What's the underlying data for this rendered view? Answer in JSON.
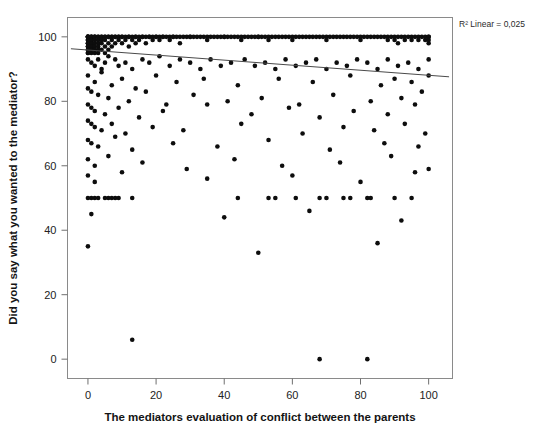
{
  "chart_data": {
    "type": "scatter",
    "title": "",
    "xlabel": "The mediators evaluation of conflict between the parents",
    "ylabel": "Did you say what you wanted to the mediator?",
    "xlim": [
      -6,
      107
    ],
    "ylim": [
      -6,
      106
    ],
    "xticks": [
      0,
      20,
      40,
      60,
      80,
      100
    ],
    "xticklabels": [
      "0",
      "20",
      "40",
      "60",
      "80",
      "100"
    ],
    "yticks": [
      0,
      20,
      40,
      60,
      80,
      100
    ],
    "yticklabels": [
      "0",
      "20",
      "40",
      "60",
      "80",
      "100"
    ],
    "grid": false,
    "legend": null,
    "annotations": [
      {
        "name": "r-squared-label",
        "text": "R² Linear = 0,025",
        "x": 107,
        "y": 105,
        "position": "top-right-outside"
      }
    ],
    "fit_line": {
      "name": "linear-fit",
      "type": "line",
      "r_squared": 0.025,
      "x": [
        -5,
        106
      ],
      "y": [
        96.3,
        87.6
      ],
      "slope": -0.0784,
      "intercept": 95.9
    },
    "marker": {
      "shape": "circle",
      "color": "#0d0d0d",
      "size": 2.3
    },
    "points": [
      [
        0,
        100
      ],
      [
        0,
        100
      ],
      [
        0,
        100
      ],
      [
        0,
        100
      ],
      [
        0,
        100
      ],
      [
        0,
        99
      ],
      [
        0,
        99
      ],
      [
        0,
        98
      ],
      [
        0,
        98
      ],
      [
        0,
        97
      ],
      [
        0,
        97
      ],
      [
        0,
        96
      ],
      [
        0,
        96
      ],
      [
        0,
        95
      ],
      [
        0,
        95
      ],
      [
        1,
        100
      ],
      [
        1,
        100
      ],
      [
        1,
        100
      ],
      [
        1,
        99
      ],
      [
        1,
        99
      ],
      [
        1,
        98
      ],
      [
        1,
        97
      ],
      [
        1,
        96
      ],
      [
        1,
        95
      ],
      [
        2,
        100
      ],
      [
        2,
        100
      ],
      [
        2,
        100
      ],
      [
        2,
        99
      ],
      [
        2,
        98
      ],
      [
        2,
        97
      ],
      [
        2,
        96
      ],
      [
        2,
        95
      ],
      [
        3,
        100
      ],
      [
        3,
        100
      ],
      [
        3,
        99
      ],
      [
        3,
        98
      ],
      [
        3,
        97
      ],
      [
        3,
        96
      ],
      [
        3,
        95
      ],
      [
        4,
        100
      ],
      [
        4,
        100
      ],
      [
        4,
        99
      ],
      [
        4,
        98
      ],
      [
        4,
        96
      ],
      [
        5,
        100
      ],
      [
        5,
        100
      ],
      [
        5,
        99
      ],
      [
        5,
        97
      ],
      [
        5,
        95
      ],
      [
        6,
        100
      ],
      [
        6,
        100
      ],
      [
        6,
        98
      ],
      [
        6,
        96
      ],
      [
        7,
        100
      ],
      [
        7,
        100
      ],
      [
        7,
        99
      ],
      [
        7,
        97
      ],
      [
        8,
        100
      ],
      [
        8,
        100
      ],
      [
        8,
        98
      ],
      [
        9,
        100
      ],
      [
        9,
        100
      ],
      [
        9,
        99
      ],
      [
        10,
        100
      ],
      [
        10,
        100
      ],
      [
        10,
        98
      ],
      [
        11,
        100
      ],
      [
        11,
        99
      ],
      [
        12,
        100
      ],
      [
        12,
        100
      ],
      [
        12,
        97
      ],
      [
        13,
        100
      ],
      [
        13,
        99
      ],
      [
        14,
        100
      ],
      [
        14,
        100
      ],
      [
        14,
        98
      ],
      [
        15,
        100
      ],
      [
        15,
        99
      ],
      [
        16,
        100
      ],
      [
        16,
        100
      ],
      [
        17,
        100
      ],
      [
        17,
        98
      ],
      [
        18,
        100
      ],
      [
        18,
        100
      ],
      [
        19,
        100
      ],
      [
        19,
        99
      ],
      [
        20,
        100
      ],
      [
        20,
        100
      ],
      [
        21,
        100
      ],
      [
        21,
        99
      ],
      [
        22,
        100
      ],
      [
        22,
        100
      ],
      [
        23,
        100
      ],
      [
        24,
        100
      ],
      [
        24,
        99
      ],
      [
        25,
        100
      ],
      [
        25,
        100
      ],
      [
        26,
        100
      ],
      [
        27,
        100
      ],
      [
        27,
        98
      ],
      [
        28,
        100
      ],
      [
        29,
        100
      ],
      [
        30,
        100
      ],
      [
        30,
        100
      ],
      [
        31,
        100
      ],
      [
        32,
        100
      ],
      [
        33,
        100
      ],
      [
        34,
        100
      ],
      [
        35,
        100
      ],
      [
        35,
        99
      ],
      [
        36,
        100
      ],
      [
        37,
        100
      ],
      [
        38,
        100
      ],
      [
        39,
        100
      ],
      [
        40,
        100
      ],
      [
        40,
        100
      ],
      [
        41,
        100
      ],
      [
        42,
        100
      ],
      [
        43,
        100
      ],
      [
        44,
        100
      ],
      [
        45,
        100
      ],
      [
        45,
        99
      ],
      [
        46,
        100
      ],
      [
        47,
        100
      ],
      [
        48,
        100
      ],
      [
        49,
        100
      ],
      [
        50,
        100
      ],
      [
        50,
        100
      ],
      [
        51,
        100
      ],
      [
        52,
        100
      ],
      [
        53,
        100
      ],
      [
        53,
        99
      ],
      [
        54,
        100
      ],
      [
        55,
        100
      ],
      [
        56,
        100
      ],
      [
        57,
        100
      ],
      [
        58,
        100
      ],
      [
        59,
        100
      ],
      [
        60,
        100
      ],
      [
        60,
        99
      ],
      [
        61,
        100
      ],
      [
        62,
        100
      ],
      [
        63,
        100
      ],
      [
        64,
        100
      ],
      [
        65,
        100
      ],
      [
        66,
        100
      ],
      [
        67,
        100
      ],
      [
        68,
        100
      ],
      [
        69,
        100
      ],
      [
        70,
        100
      ],
      [
        70,
        99
      ],
      [
        71,
        100
      ],
      [
        72,
        100
      ],
      [
        73,
        100
      ],
      [
        74,
        100
      ],
      [
        75,
        100
      ],
      [
        76,
        100
      ],
      [
        77,
        100
      ],
      [
        78,
        100
      ],
      [
        79,
        100
      ],
      [
        80,
        100
      ],
      [
        80,
        99
      ],
      [
        81,
        100
      ],
      [
        82,
        100
      ],
      [
        83,
        100
      ],
      [
        84,
        100
      ],
      [
        85,
        100
      ],
      [
        86,
        100
      ],
      [
        87,
        100
      ],
      [
        88,
        100
      ],
      [
        88,
        99
      ],
      [
        89,
        100
      ],
      [
        90,
        100
      ],
      [
        90,
        99
      ],
      [
        91,
        100
      ],
      [
        91,
        98
      ],
      [
        92,
        100
      ],
      [
        93,
        100
      ],
      [
        93,
        99
      ],
      [
        94,
        100
      ],
      [
        95,
        100
      ],
      [
        95,
        99
      ],
      [
        96,
        100
      ],
      [
        97,
        100
      ],
      [
        97,
        99
      ],
      [
        98,
        100
      ],
      [
        99,
        100
      ],
      [
        99,
        99
      ],
      [
        100,
        100
      ],
      [
        100,
        100
      ],
      [
        100,
        99
      ],
      [
        100,
        98
      ],
      [
        0,
        93
      ],
      [
        1,
        92
      ],
      [
        2,
        91
      ],
      [
        3,
        93
      ],
      [
        4,
        90
      ],
      [
        5,
        92
      ],
      [
        6,
        94
      ],
      [
        8,
        93
      ],
      [
        9,
        91
      ],
      [
        11,
        92
      ],
      [
        13,
        90
      ],
      [
        16,
        93
      ],
      [
        18,
        92
      ],
      [
        21,
        94
      ],
      [
        24,
        91
      ],
      [
        27,
        93
      ],
      [
        30,
        92
      ],
      [
        33,
        90
      ],
      [
        36,
        93
      ],
      [
        39,
        91
      ],
      [
        42,
        92
      ],
      [
        46,
        93
      ],
      [
        49,
        91
      ],
      [
        52,
        92
      ],
      [
        55,
        90
      ],
      [
        58,
        93
      ],
      [
        61,
        91
      ],
      [
        64,
        92
      ],
      [
        67,
        93
      ],
      [
        70,
        90
      ],
      [
        73,
        92
      ],
      [
        76,
        91
      ],
      [
        79,
        93
      ],
      [
        82,
        92
      ],
      [
        85,
        90
      ],
      [
        88,
        93
      ],
      [
        91,
        91
      ],
      [
        94,
        92
      ],
      [
        97,
        90
      ],
      [
        100,
        93
      ],
      [
        0,
        88
      ],
      [
        2,
        86
      ],
      [
        4,
        89
      ],
      [
        7,
        85
      ],
      [
        10,
        87
      ],
      [
        14,
        84
      ],
      [
        20,
        88
      ],
      [
        26,
        86
      ],
      [
        34,
        87
      ],
      [
        44,
        85
      ],
      [
        56,
        87
      ],
      [
        66,
        86
      ],
      [
        77,
        88
      ],
      [
        86,
        85
      ],
      [
        90,
        87
      ],
      [
        95,
        86
      ],
      [
        100,
        88
      ],
      [
        0,
        84
      ],
      [
        1,
        83
      ],
      [
        3,
        82
      ],
      [
        6,
        81
      ],
      [
        12,
        80
      ],
      [
        17,
        83
      ],
      [
        23,
        79
      ],
      [
        31,
        82
      ],
      [
        41,
        80
      ],
      [
        51,
        81
      ],
      [
        62,
        79
      ],
      [
        72,
        82
      ],
      [
        83,
        80
      ],
      [
        92,
        81
      ],
      [
        98,
        83
      ],
      [
        0,
        79
      ],
      [
        1,
        78
      ],
      [
        2,
        77
      ],
      [
        5,
        76
      ],
      [
        9,
        78
      ],
      [
        15,
        75
      ],
      [
        22,
        77
      ],
      [
        35,
        79
      ],
      [
        48,
        76
      ],
      [
        59,
        78
      ],
      [
        68,
        75
      ],
      [
        78,
        77
      ],
      [
        88,
        76
      ],
      [
        96,
        79
      ],
      [
        0,
        74
      ],
      [
        1,
        73
      ],
      [
        2,
        72
      ],
      [
        4,
        71
      ],
      [
        7,
        73
      ],
      [
        11,
        70
      ],
      [
        19,
        72
      ],
      [
        28,
        71
      ],
      [
        45,
        73
      ],
      [
        63,
        70
      ],
      [
        75,
        72
      ],
      [
        84,
        71
      ],
      [
        93,
        73
      ],
      [
        99,
        70
      ],
      [
        0,
        68
      ],
      [
        1,
        67
      ],
      [
        3,
        66
      ],
      [
        8,
        69
      ],
      [
        13,
        65
      ],
      [
        25,
        67
      ],
      [
        38,
        66
      ],
      [
        53,
        68
      ],
      [
        71,
        65
      ],
      [
        87,
        67
      ],
      [
        97,
        66
      ],
      [
        0,
        62
      ],
      [
        2,
        60
      ],
      [
        6,
        63
      ],
      [
        16,
        61
      ],
      [
        29,
        59
      ],
      [
        43,
        62
      ],
      [
        57,
        60
      ],
      [
        74,
        61
      ],
      [
        89,
        63
      ],
      [
        100,
        59
      ],
      [
        0,
        50
      ],
      [
        1,
        50
      ],
      [
        2,
        50
      ],
      [
        3,
        50
      ],
      [
        5,
        50
      ],
      [
        6,
        50
      ],
      [
        7,
        50
      ],
      [
        8,
        50
      ],
      [
        9,
        50
      ],
      [
        13,
        50
      ],
      [
        44,
        50
      ],
      [
        53,
        50
      ],
      [
        55,
        50
      ],
      [
        61,
        50
      ],
      [
        68,
        50
      ],
      [
        70,
        50
      ],
      [
        75,
        50
      ],
      [
        77,
        50
      ],
      [
        82,
        50
      ],
      [
        83,
        50
      ],
      [
        90,
        50
      ],
      [
        95,
        50
      ],
      [
        13,
        6
      ],
      [
        68,
        0
      ],
      [
        82,
        0
      ],
      [
        0,
        57
      ],
      [
        2,
        55
      ],
      [
        10,
        58
      ],
      [
        35,
        56
      ],
      [
        60,
        57
      ],
      [
        80,
        55
      ],
      [
        96,
        58
      ],
      [
        1,
        45
      ],
      [
        40,
        44
      ],
      [
        65,
        46
      ],
      [
        92,
        43
      ],
      [
        0,
        35
      ],
      [
        50,
        33
      ],
      [
        85,
        36
      ]
    ]
  },
  "axes": {
    "frame_color": "#8a8a8a",
    "background": "#ffffff"
  }
}
